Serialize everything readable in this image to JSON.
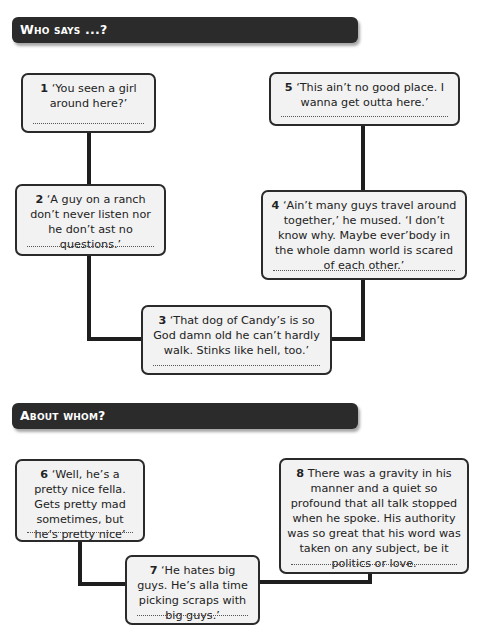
{
  "sections": [
    {
      "title": "Who says ...?",
      "quotes": [
        {
          "number": "1",
          "text": "‘You seen a girl around here?’"
        },
        {
          "number": "2",
          "text": "‘A guy on a ranch don’t never listen nor he don’t ast no questions.’"
        },
        {
          "number": "3",
          "text": "‘That dog of Candy’s is so God damn old he can’t hardly walk. Stinks like hell, too.’"
        },
        {
          "number": "4",
          "text": "‘Ain’t many guys travel around together,’ he mused. ‘I don’t know why. Maybe ever’body in the whole damn world is scared of each other.’"
        },
        {
          "number": "5",
          "text": "‘This ain’t no good place. I wanna get outta here.’"
        }
      ]
    },
    {
      "title": "About whom?",
      "quotes": [
        {
          "number": "6",
          "text": "‘Well, he’s a pretty nice fella. Gets pretty mad sometimes, but he’s pretty nice’"
        },
        {
          "number": "7",
          "text": "‘He hates big guys. He’s alla time picking scraps with big guys.’"
        },
        {
          "number": "8",
          "text": "There was a gravity in his manner and a quiet so profound that all talk stopped when he spoke. His authority was so great that his word was taken on any subject, be it politics or love."
        }
      ]
    }
  ],
  "colors": {
    "banner_bg": "#2b2b2b",
    "banner_text": "#ffffff",
    "box_bg": "#f2f2f2",
    "box_border": "#2a2a2a",
    "connector": "#1e1e1e"
  }
}
